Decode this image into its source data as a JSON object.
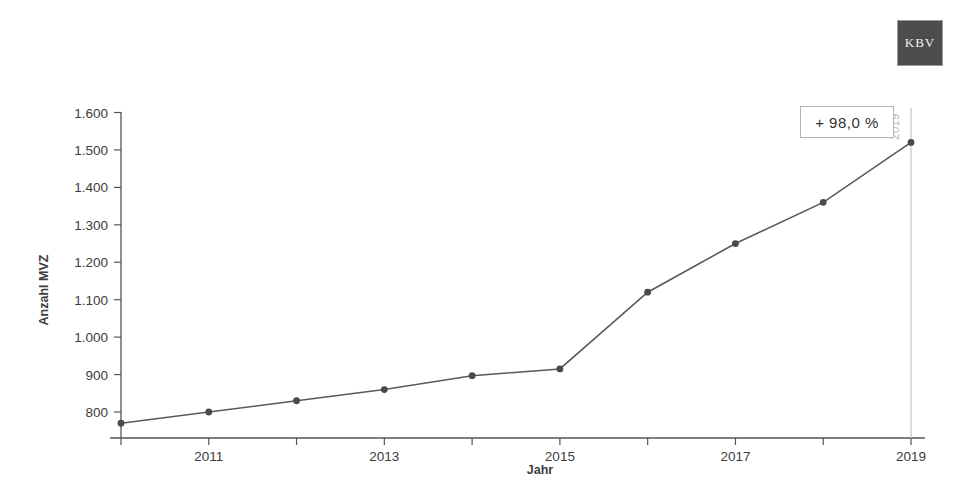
{
  "logo": {
    "text": "KBV",
    "background": "#4c4c4c",
    "color": "#f2f2f2"
  },
  "callout": {
    "label": "+ 98,0 %"
  },
  "reference_line": {
    "label": "2019",
    "color": "#c4c4c4"
  },
  "colors": {
    "line": "#5a5a5a",
    "marker": "#4a4a4a",
    "axis": "#555555",
    "text": "#3d3d3d",
    "background": "#ffffff"
  },
  "chart_data": {
    "type": "line",
    "title": "",
    "xlabel": "Jahr",
    "ylabel": "Anzahl MVZ",
    "x": [
      2010,
      2011,
      2012,
      2013,
      2014,
      2015,
      2016,
      2017,
      2018,
      2019
    ],
    "values": [
      770,
      800,
      830,
      860,
      897,
      915,
      1120,
      1250,
      1360,
      1520
    ],
    "series": [
      {
        "name": "Anzahl MVZ",
        "values": [
          770,
          800,
          830,
          860,
          897,
          915,
          1120,
          1250,
          1360,
          1520
        ]
      }
    ],
    "xtick_labels": [
      "2011",
      "2013",
      "2015",
      "2017",
      "2019"
    ],
    "xtick_values": [
      2011,
      2013,
      2015,
      2017,
      2019
    ],
    "ytick_labels": [
      "800",
      "900",
      "1.000",
      "1.100",
      "1.200",
      "1.300",
      "1.400",
      "1.500",
      "1.600"
    ],
    "ytick_values": [
      800,
      900,
      1000,
      1100,
      1200,
      1300,
      1400,
      1500,
      1600
    ],
    "xlim": [
      2010,
      2019
    ],
    "ylim": [
      760,
      1600
    ],
    "grid": false,
    "legend": false,
    "markers": true,
    "annotations": [
      {
        "text": "+ 98,0 %",
        "kind": "box"
      },
      {
        "text": "2019",
        "kind": "reference-line-label"
      }
    ]
  }
}
